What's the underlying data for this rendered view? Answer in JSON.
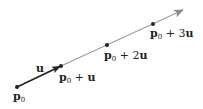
{
  "diagram": {
    "type": "parametric-line",
    "colors": {
      "line": "#8a8a8a",
      "vector": "#222222",
      "point": "#222222",
      "text": "#222222"
    },
    "points": [
      {
        "id": "p0",
        "x": 17,
        "y": 87,
        "label_base": "p",
        "label_sub": "0",
        "label_suffix": ""
      },
      {
        "id": "p0_u",
        "x": 61,
        "y": 66,
        "label_base": "p",
        "label_sub": "0",
        "label_suffix": " + u"
      },
      {
        "id": "p0_2u",
        "x": 107,
        "y": 45,
        "label_base": "p",
        "label_sub": "0",
        "label_suffix": " + 2u"
      },
      {
        "id": "p0_3u",
        "x": 153,
        "y": 24,
        "label_base": "p",
        "label_sub": "0",
        "label_suffix": " + 3u"
      }
    ],
    "vector_label": "u",
    "labels": {
      "p0": {
        "base": "p",
        "sub": "0",
        "rest": ""
      },
      "p0_u": {
        "base": "p",
        "sub": "0",
        "plus": " + ",
        "coef": "",
        "vec": "u"
      },
      "p0_2u": {
        "base": "p",
        "sub": "0",
        "plus": " + ",
        "coef": "2",
        "vec": "u"
      },
      "p0_3u": {
        "base": "p",
        "sub": "0",
        "plus": " + ",
        "coef": "3",
        "vec": "u"
      },
      "u": "u"
    }
  }
}
